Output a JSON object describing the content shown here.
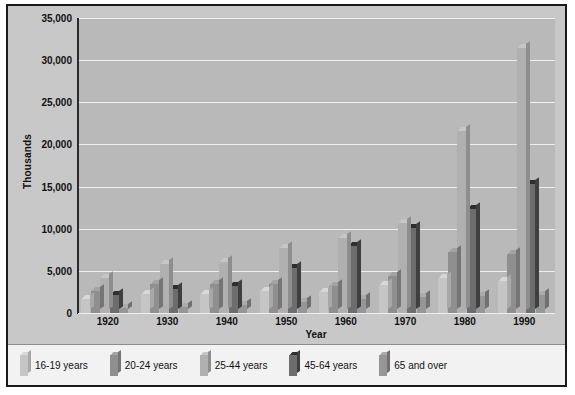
{
  "chart_data": {
    "type": "bar",
    "title": "",
    "xlabel": "Year",
    "ylabel": "Thousands",
    "categories": [
      "1920",
      "1930",
      "1940",
      "1950",
      "1960",
      "1970",
      "1980",
      "1990"
    ],
    "ylim": [
      0,
      35000
    ],
    "ytick_labels": [
      "0",
      "5,000",
      "10,000",
      "15,000",
      "20,000",
      "25,000",
      "30,000",
      "35,000"
    ],
    "ytick_values": [
      0,
      5000,
      10000,
      15000,
      20000,
      25000,
      30000,
      35000
    ],
    "grid": true,
    "legend_position": "bottom",
    "series": [
      {
        "name": "16-19 years",
        "color": "#c5c5c5",
        "side": "#a8a8a8",
        "top": "#d8d8d8",
        "values": [
          1700,
          2200,
          2300,
          2600,
          2500,
          3300,
          4100,
          3800
        ]
      },
      {
        "name": "20-24 years",
        "color": "#8f8f8f",
        "side": "#757575",
        "top": "#a3a3a3",
        "values": [
          2600,
          3400,
          3400,
          3500,
          3200,
          4400,
          7200,
          7000
        ]
      },
      {
        "name": "25-44 years",
        "color": "#b0b0b0",
        "side": "#8e8e8e",
        "top": "#c6c6c6",
        "values": [
          4100,
          5800,
          6100,
          7700,
          8900,
          10700,
          21600,
          31500
        ]
      },
      {
        "name": "45-64 years",
        "color": "#6d6d6d",
        "side": "#3f3f3f",
        "top": "#2e2e2e",
        "values": [
          2100,
          2800,
          3200,
          5300,
          7900,
          10100,
          12300,
          15300
        ]
      },
      {
        "name": "65 and over",
        "color": "#969696",
        "side": "#707070",
        "top": "#ababab",
        "values": [
          600,
          700,
          900,
          1300,
          1700,
          1900,
          2000,
          2100
        ]
      }
    ]
  }
}
